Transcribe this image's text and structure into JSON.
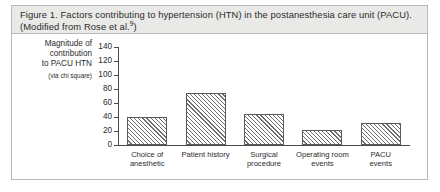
{
  "figure": {
    "caption_prefix": "Figure 1.",
    "caption": "Figure 1.  Factors contributing to hypertension (HTN) in the postanesthesia care unit (PACU). (Modified from Rose et al.",
    "caption_citation": "9",
    "caption_suffix": ")"
  },
  "axis_title": {
    "line1": "Magnitude of",
    "line2": "contribution",
    "line3": "to PACU HTN",
    "line4": "(via chi square)"
  },
  "colors": {
    "caption_background": "#e9e9e7",
    "panel_border": "#b9b9b6",
    "axis": "#4a4a4a",
    "bar_outline": "#5a5a5a",
    "bar_hatch": "#6e6e6e",
    "text": "#2b2b2b"
  },
  "chart_data": {
    "type": "bar",
    "title": "Factors contributing to hypertension (HTN) in the postanesthesia care unit (PACU)",
    "xlabel": "",
    "ylabel": "Magnitude of contribution to PACU HTN (via chi square)",
    "categories": [
      "Choice of anesthetic",
      "Patient history",
      "Surgical procedure",
      "Operating room events",
      "PACU events"
    ],
    "category_lines": [
      [
        "Choice of",
        "anesthetic"
      ],
      [
        "Patient history",
        ""
      ],
      [
        "Surgical",
        "procedure"
      ],
      [
        "Operating room",
        "events"
      ],
      [
        "PACU",
        "events"
      ]
    ],
    "values": [
      40,
      75,
      45,
      22,
      32
    ],
    "ylim": [
      0,
      140
    ],
    "yticks": [
      0,
      20,
      40,
      60,
      80,
      100,
      120,
      140
    ],
    "ytick_labels": [
      "0",
      "20",
      "40",
      "60",
      "80",
      "100",
      "120",
      "140"
    ],
    "grid": false,
    "legend": false
  }
}
